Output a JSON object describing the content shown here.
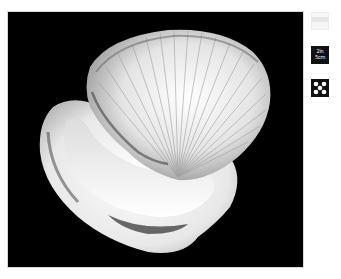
{
  "viewer": {
    "main_image": {
      "subject": "cockle seashell",
      "background_color": "#000000"
    },
    "thumbnails": [
      {
        "id": "background",
        "icon": "white-background-icon",
        "color": "#f6f6f6"
      },
      {
        "id": "scale",
        "icon": "scale-icon",
        "line1": "2in",
        "line2": "5cm",
        "color": "#111111"
      },
      {
        "id": "pattern",
        "icon": "dot-pattern-icon",
        "color": "#111111"
      }
    ]
  }
}
